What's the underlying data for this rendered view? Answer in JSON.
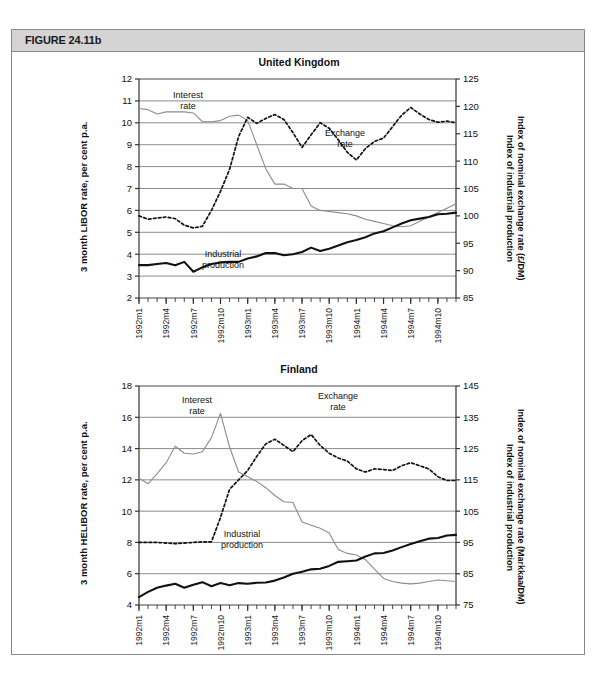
{
  "figure": {
    "caption": "FIGURE 24.11b",
    "header_bg": "#d4d4d4",
    "border_color": "#8a8a8a"
  },
  "series_style": {
    "interest_rate_color": "#8c8c8c",
    "exchange_rate_color": "#111111",
    "industrial_production_color": "#111111",
    "gridline_color": "#6f6f6f"
  },
  "chart_data": [
    {
      "type": "line",
      "title": "United Kingdom",
      "xlabel": "",
      "ylabel": "3 month LIBOR rate, per cent p.a.",
      "y2label": "Index of nominal exchange rate (£/DM)\nIndex of industrial production",
      "y2label_line1": "Index of nominal exchange rate (£/DM)",
      "y2label_line2": "Index of industrial production",
      "ylim": [
        2,
        12
      ],
      "yticks": [
        2,
        3,
        4,
        5,
        6,
        7,
        8,
        9,
        10,
        11,
        12
      ],
      "y2lim": [
        85,
        125
      ],
      "y2ticks": [
        85,
        90,
        95,
        100,
        105,
        110,
        115,
        120,
        125
      ],
      "grid": true,
      "legend_position": "inline-annotations",
      "xticklabels": [
        "1992m1",
        "1992m4",
        "1992m7",
        "1992m10",
        "1993m1",
        "1993m4",
        "1993m7",
        "1993m10",
        "1994m1",
        "1994m4",
        "1994m7",
        "1994m10"
      ],
      "xtick_indices": [
        0,
        3,
        6,
        9,
        12,
        15,
        18,
        21,
        24,
        27,
        30,
        33
      ],
      "x": [
        "1992m1",
        "1992m2",
        "1992m3",
        "1992m4",
        "1992m5",
        "1992m6",
        "1992m7",
        "1992m8",
        "1992m9",
        "1992m10",
        "1992m11",
        "1992m12",
        "1993m1",
        "1993m2",
        "1993m3",
        "1993m4",
        "1993m5",
        "1993m6",
        "1993m7",
        "1993m8",
        "1993m9",
        "1993m10",
        "1993m11",
        "1993m12",
        "1994m1",
        "1994m2",
        "1994m3",
        "1994m4",
        "1994m5",
        "1994m6",
        "1994m7",
        "1994m8",
        "1994m9",
        "1994m10",
        "1994m11",
        "1994m12"
      ],
      "annotations": [
        {
          "text": "Interest\nrate",
          "line1": "Interest",
          "line2": "rate",
          "series": "Interest rate"
        },
        {
          "text": "Exchange\nrate",
          "line1": "Exchange",
          "line2": "rate",
          "series": "Exchange rate"
        },
        {
          "text": "Industrial\nproduction",
          "line1": "Industrial",
          "line2": "production",
          "series": "Industrial production"
        }
      ],
      "series": [
        {
          "name": "Interest rate",
          "axis": "left",
          "style": "solid-gray",
          "unit": "per cent p.a.",
          "values": [
            10.65,
            10.6,
            10.4,
            10.5,
            10.5,
            10.5,
            10.45,
            10.05,
            10.05,
            10.1,
            10.3,
            10.35,
            10.1,
            9.0,
            7.9,
            7.2,
            7.2,
            7.0,
            7.0,
            6.2,
            6.0,
            5.95,
            5.9,
            5.85,
            5.75,
            5.6,
            5.5,
            5.4,
            5.3,
            5.25,
            5.3,
            5.5,
            5.7,
            5.9,
            6.1,
            6.3
          ]
        },
        {
          "name": "Exchange rate",
          "axis": "right",
          "style": "dashed-black",
          "unit": "index (£/DM)",
          "values": [
            100.0,
            99.4,
            99.6,
            99.8,
            99.5,
            98.3,
            97.8,
            98.1,
            101.0,
            104.5,
            108.5,
            114.5,
            118.0,
            116.9,
            117.8,
            118.5,
            117.6,
            115.2,
            112.5,
            114.8,
            117.0,
            116.0,
            113.9,
            111.6,
            110.2,
            112.3,
            113.6,
            114.2,
            116.3,
            118.4,
            119.8,
            118.6,
            117.6,
            117.1,
            117.3,
            117.0
          ]
        },
        {
          "name": "Industrial production",
          "axis": "right",
          "style": "solid-thick-black",
          "unit": "index",
          "values": [
            91.0,
            91.0,
            91.2,
            91.4,
            91.0,
            91.6,
            89.8,
            90.6,
            91.2,
            91.5,
            91.6,
            91.6,
            92.2,
            92.6,
            93.2,
            93.2,
            92.8,
            93.0,
            93.4,
            94.2,
            93.6,
            94.0,
            94.6,
            95.2,
            95.6,
            96.1,
            96.8,
            97.2,
            97.9,
            98.6,
            99.2,
            99.5,
            99.8,
            100.3,
            100.4,
            100.6
          ]
        }
      ]
    },
    {
      "type": "line",
      "title": "Finland",
      "xlabel": "",
      "ylabel": "3 month HELIBOR rate, per cent p.a.",
      "y2label_line1": "Index of nominal exchange rate (Markkaa/DM)",
      "y2label_line2": "Index of industrial production",
      "ylim": [
        4,
        18
      ],
      "yticks": [
        4,
        6,
        8,
        10,
        12,
        14,
        16,
        18
      ],
      "y2lim": [
        75,
        145
      ],
      "y2ticks": [
        75,
        85,
        95,
        105,
        115,
        125,
        135,
        145
      ],
      "grid": true,
      "legend_position": "inline-annotations",
      "xticklabels": [
        "1992m1",
        "1992m4",
        "1992m7",
        "1992m10",
        "1993m1",
        "1993m4",
        "1993m7",
        "1993m10",
        "1994m1",
        "1994m4",
        "1994m7",
        "1994m10"
      ],
      "xtick_indices": [
        0,
        3,
        6,
        9,
        12,
        15,
        18,
        21,
        24,
        27,
        30,
        33
      ],
      "x": [
        "1992m1",
        "1992m2",
        "1992m3",
        "1992m4",
        "1992m5",
        "1992m6",
        "1992m7",
        "1992m8",
        "1992m9",
        "1992m10",
        "1992m11",
        "1992m12",
        "1993m1",
        "1993m2",
        "1993m3",
        "1993m4",
        "1993m5",
        "1993m6",
        "1993m7",
        "1993m8",
        "1993m9",
        "1993m10",
        "1993m11",
        "1993m12",
        "1994m1",
        "1994m2",
        "1994m3",
        "1994m4",
        "1994m5",
        "1994m6",
        "1994m7",
        "1994m8",
        "1994m9",
        "1994m10",
        "1994m11",
        "1994m12"
      ],
      "annotations": [
        {
          "text": "Interest\nrate",
          "line1": "Interest",
          "line2": "rate",
          "series": "Interest rate"
        },
        {
          "text": "Exchange\nrate",
          "line1": "Exchange",
          "line2": "rate",
          "series": "Exchange rate"
        },
        {
          "text": "Industrial\nproduction",
          "line1": "Industrial",
          "line2": "production",
          "series": "Industrial production"
        }
      ],
      "series": [
        {
          "name": "Interest rate",
          "axis": "left",
          "style": "solid-gray",
          "unit": "per cent p.a.",
          "values": [
            12.1,
            11.75,
            12.4,
            13.1,
            14.15,
            13.7,
            13.65,
            13.8,
            14.7,
            16.25,
            14.1,
            12.5,
            12.2,
            11.9,
            11.5,
            11.0,
            10.6,
            10.55,
            9.3,
            9.1,
            8.9,
            8.6,
            7.55,
            7.3,
            7.2,
            6.9,
            6.3,
            5.7,
            5.5,
            5.4,
            5.35,
            5.4,
            5.5,
            5.6,
            5.55,
            5.5
          ]
        },
        {
          "name": "Exchange rate",
          "axis": "right",
          "style": "dashed-black",
          "unit": "index (Markkaa/DM)",
          "values": [
            95.0,
            95.0,
            95.0,
            94.8,
            94.6,
            94.8,
            95.0,
            95.2,
            95.2,
            103.0,
            112.0,
            115.0,
            118.0,
            122.5,
            126.5,
            128.0,
            126.0,
            124.0,
            127.5,
            129.5,
            126.0,
            123.5,
            122.0,
            121.0,
            118.5,
            117.5,
            118.5,
            118.3,
            118.0,
            119.5,
            120.5,
            119.5,
            118.5,
            116.0,
            114.8,
            114.8
          ]
        },
        {
          "name": "Industrial production",
          "axis": "right",
          "style": "solid-thick-black",
          "unit": "index",
          "values": [
            77.5,
            79.2,
            80.5,
            81.2,
            81.8,
            80.5,
            81.5,
            82.3,
            81.0,
            82.0,
            81.3,
            82.0,
            81.8,
            82.1,
            82.2,
            82.8,
            83.8,
            85.0,
            85.6,
            86.4,
            86.6,
            87.5,
            88.8,
            89.0,
            89.2,
            90.5,
            91.5,
            91.6,
            92.4,
            93.5,
            94.5,
            95.4,
            96.2,
            96.4,
            97.2,
            97.4
          ]
        }
      ]
    }
  ]
}
